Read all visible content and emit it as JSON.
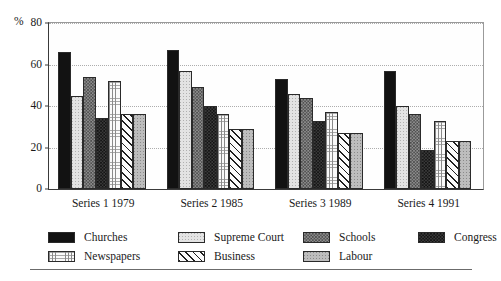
{
  "chart_data": {
    "type": "bar",
    "title": "",
    "subtitle": "",
    "xlabel": "",
    "ylabel": "%",
    "ylim": [
      0,
      80
    ],
    "yticks": [
      0,
      20,
      40,
      60,
      80
    ],
    "grid": true,
    "legend_position": "bottom",
    "categories": [
      "Series 1 1979",
      "Series 2 1985",
      "Series 3 1989",
      "Series 4 1991"
    ],
    "series": [
      {
        "name": "Churches",
        "pattern": "solid-black",
        "values": [
          66,
          67,
          53,
          57
        ]
      },
      {
        "name": "Supreme Court",
        "pattern": "light-dotted",
        "values": [
          45,
          57,
          46,
          40
        ]
      },
      {
        "name": "Schools",
        "pattern": "gray-checker",
        "values": [
          54,
          49,
          44,
          36
        ]
      },
      {
        "name": "Congress",
        "pattern": "dark-checker",
        "values": [
          34,
          40,
          33,
          19
        ]
      },
      {
        "name": "Newspapers",
        "pattern": "grid-lines",
        "values": [
          52,
          36,
          37,
          33
        ]
      },
      {
        "name": "Business",
        "pattern": "diagonal-hatch",
        "values": [
          36,
          29,
          27,
          23
        ]
      },
      {
        "name": "Labour",
        "pattern": "mid-gray-dotted",
        "values": [
          36,
          29,
          27,
          23
        ]
      }
    ]
  },
  "axis": {
    "y_label": "%",
    "y_tick_labels": [
      "0",
      "20",
      "40",
      "60",
      "80"
    ]
  },
  "legend": {
    "entries": [
      {
        "label": "Churches"
      },
      {
        "label": "Supreme Court"
      },
      {
        "label": "Schools"
      },
      {
        "label": "Congress"
      },
      {
        "label": "Newspapers"
      },
      {
        "label": "Business"
      },
      {
        "label": "Labour"
      }
    ]
  },
  "colors": {
    "axis": "#3a3a3a",
    "grid": "#adadad",
    "text": "#1a1a1a",
    "rule": "#6b6b6b",
    "churches": "#121212",
    "supreme_court": "#e3e3e3",
    "schools": "#8e8e8e",
    "congress": "#3c3c3c",
    "newspapers": "#fafafa",
    "business": "#fbfbfb",
    "labour": "#bdbdbd"
  }
}
